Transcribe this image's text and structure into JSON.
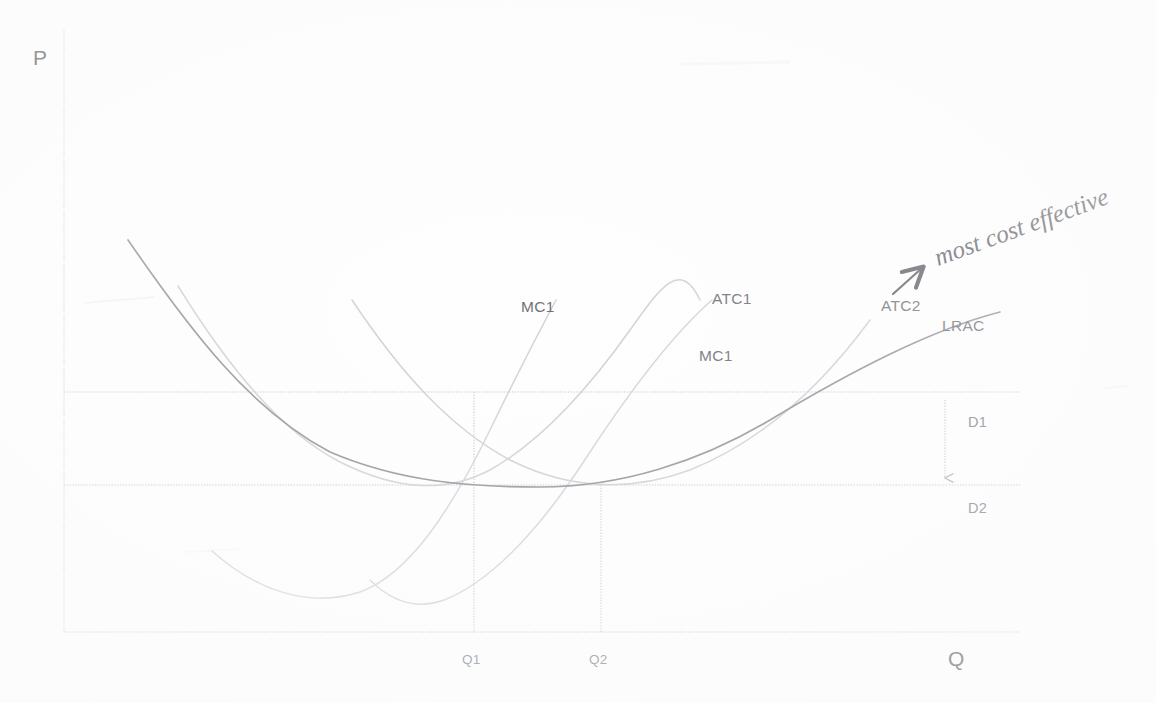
{
  "figure": {
    "title_visible": false,
    "background_color": "#ffffff",
    "axes": {
      "y_label": "P",
      "x_label": "Q",
      "axis_color": "#d8d8dc",
      "origin_px": [
        64,
        632
      ],
      "y_top_px": 30,
      "x_right_px": 1020
    },
    "handwriting": {
      "note": "most cost effective",
      "arrow": "diagonal-up-right-arrow",
      "ink_color": "#5e6066"
    },
    "curve_labels": [
      {
        "id": "mc1-left",
        "text": "MC1",
        "x": 521,
        "y": 312
      },
      {
        "id": "atc1",
        "text": "ATC1",
        "x": 712,
        "y": 304
      },
      {
        "id": "mc1-right",
        "text": "MC1",
        "x": 699,
        "y": 361
      },
      {
        "id": "atc2",
        "text": "ATC2",
        "x": 881,
        "y": 311
      },
      {
        "id": "lrac",
        "text": "LRAC",
        "x": 942,
        "y": 331
      }
    ],
    "tick_labels": [
      {
        "id": "q1",
        "text": "Q1",
        "x": 466,
        "y": 662
      },
      {
        "id": "q2",
        "text": "Q2",
        "x": 592,
        "y": 662
      }
    ],
    "shift_labels": [
      {
        "id": "d1",
        "text": "D1",
        "x": 968,
        "y": 427
      },
      {
        "id": "d2",
        "text": "D2",
        "x": 968,
        "y": 513
      }
    ],
    "guide_lines": {
      "price_line_1_y": 392,
      "price_line_2_y": 485,
      "q1_x": 474,
      "q2_x": 601,
      "color": "#c9c9cf"
    },
    "shift_arrow": {
      "from": [
        945,
        400
      ],
      "to": [
        945,
        480
      ],
      "direction": "down"
    }
  },
  "chart_data": {
    "type": "line",
    "title": "",
    "xlabel": "Q",
    "ylabel": "P",
    "grid": false,
    "legend": "inline-curve-labels",
    "xlim": [
      0,
      1020
    ],
    "ylim": [
      0,
      632
    ],
    "annotations": [
      {
        "text": "most cost effective",
        "kind": "handwritten",
        "points_to": "LRAC minimum / ATC2 tangency"
      },
      {
        "text": "D1",
        "kind": "demand-level-1"
      },
      {
        "text": "D2",
        "kind": "demand-level-2"
      }
    ],
    "reference_lines": [
      {
        "name": "D1",
        "orientation": "horizontal",
        "value": 392,
        "style": "dotted"
      },
      {
        "name": "D2",
        "orientation": "horizontal",
        "value": 485,
        "style": "dotted"
      },
      {
        "name": "Q1",
        "orientation": "vertical",
        "value": 474,
        "style": "dotted"
      },
      {
        "name": "Q2",
        "orientation": "vertical",
        "value": 601,
        "style": "dotted"
      }
    ],
    "series": [
      {
        "name": "LRAC",
        "role": "long-run-average-cost-envelope",
        "style": "solid-dark",
        "path": "M 128,240 C 190,330 250,410 330,452 C 400,482 470,487 540,487 C 620,487 700,462 770,420 C 850,372 930,330 1000,312"
      },
      {
        "name": "ATC1",
        "role": "short-run-average-cost-plant-1",
        "style": "faint",
        "path": "M 178,286 C 230,370 282,432 340,462 C 400,492 448,492 490,470 C 540,442 586,392 630,330 C 660,288 680,258 700,300"
      },
      {
        "name": "MC1",
        "role": "marginal-cost-plant-1",
        "style": "faint",
        "path": "M 212,551 C 258,592 310,608 360,592 C 410,574 452,508 490,430 C 520,368 540,330 556,300"
      },
      {
        "name": "ATC2",
        "role": "short-run-average-cost-plant-2",
        "style": "faint",
        "path": "M 352,300 C 400,372 450,428 510,460 C 570,490 630,492 690,470 C 760,442 820,388 870,320"
      },
      {
        "name": "MC2",
        "role": "marginal-cost-plant-2",
        "style": "faint",
        "path": "M 370,580 C 392,602 416,610 444,600 C 490,582 540,530 590,452 C 640,376 680,328 712,300"
      }
    ],
    "key_points": [
      {
        "label": "Q1",
        "x": 474,
        "note": "ATC1 tangency / MC1 crossing with price line D1"
      },
      {
        "label": "Q2",
        "x": 601,
        "note": "LRAC minimum, ATC2 tangency at price line D2"
      }
    ]
  }
}
